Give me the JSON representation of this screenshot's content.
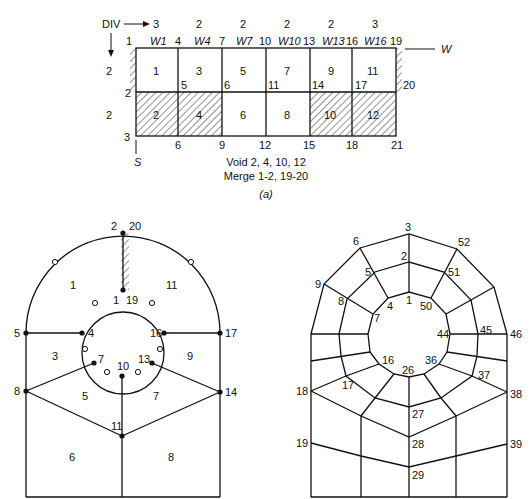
{
  "figure_a": {
    "div_label": "DIV",
    "col_divs": [
      "3",
      "2",
      "2",
      "2",
      "2",
      "3"
    ],
    "row_divs": [
      "2",
      "2"
    ],
    "col_headers": [
      "W1",
      "W4",
      "W7",
      "W10",
      "W13",
      "W16"
    ],
    "top_nodes": [
      "1",
      "4",
      "7",
      "10",
      "13",
      "16",
      "19"
    ],
    "mid_nodes": [
      "2",
      "5",
      "6",
      "11",
      "14",
      "17",
      "20"
    ],
    "bottom_nodes": [
      "3",
      "6",
      "9",
      "12",
      "15",
      "18",
      "21"
    ],
    "elements_top": [
      "1",
      "3",
      "5",
      "7",
      "9",
      "11"
    ],
    "elements_bottom": [
      "2",
      "4",
      "6",
      "8",
      "10",
      "12"
    ],
    "w_axis": "W",
    "s_axis": "S",
    "void_text": "Void 2, 4, 10, 12",
    "merge_text": "Merge 1-2, 19-20",
    "caption": "(a)"
  },
  "figure_b": {
    "node_labels": {
      "n2_20": "2",
      "n20": "20",
      "n1": "1",
      "n19": "19",
      "n5": "5",
      "n4": "4",
      "n16": "16",
      "n17": "17",
      "n7": "7",
      "n10": "10",
      "n13": "13",
      "n8": "8",
      "n14": "14",
      "n11": "11"
    },
    "element_labels": {
      "e1": "1",
      "e11": "11",
      "e3": "3",
      "e9": "9",
      "e5": "5",
      "e7": "7",
      "e6": "6",
      "e8": "8"
    }
  },
  "figure_c": {
    "node_labels": {
      "n3": "3",
      "n6": "6",
      "n52": "52",
      "n2": "2",
      "n5": "5",
      "n51": "51",
      "n9": "9",
      "n8": "8",
      "n4": "4",
      "n1": "1",
      "n50": "50",
      "n7": "7",
      "n44": "44",
      "n45": "45",
      "n46": "46",
      "n16": "16",
      "n26": "26",
      "n36": "36",
      "n17": "17",
      "n37": "37",
      "n18": "18",
      "n38": "38",
      "n27": "27",
      "n28": "28",
      "n19": "19",
      "n39": "39",
      "n29": "29"
    }
  }
}
